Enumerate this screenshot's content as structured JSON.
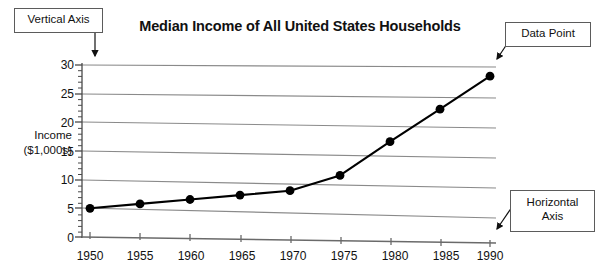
{
  "chart_data": {
    "type": "line",
    "title": "Median Income of All United States Households",
    "xlabel": "",
    "ylabel": "Income ($1,000s)",
    "ylabel_lines": [
      "Income",
      "($1,000s)"
    ],
    "x": [
      1950,
      1955,
      1960,
      1965,
      1970,
      1975,
      1980,
      1985,
      1990
    ],
    "values": [
      5.0,
      5.9,
      6.8,
      7.7,
      8.6,
      11.4,
      17.4,
      23.2,
      29.1
    ],
    "xticks": [
      "1950",
      "1955",
      "1960",
      "1965",
      "1970",
      "1975",
      "1980",
      "1985",
      "1990"
    ],
    "yticks": [
      "0",
      "5",
      "10",
      "15",
      "20",
      "25",
      "30"
    ],
    "ytick_values": [
      0,
      5,
      10,
      15,
      20,
      25,
      30
    ],
    "xlim": [
      1950,
      1990
    ],
    "ylim": [
      0,
      30
    ],
    "grid": true,
    "grid_axis": "y",
    "legend": false,
    "minor_ticks_y": true,
    "marker": "filled-circle",
    "line_color": "#000000",
    "marker_color": "#000000",
    "grid_color": "#888888",
    "axis_color": "#555555"
  },
  "annotations": [
    {
      "id": "vertical-axis",
      "label": "Vertical Axis",
      "lines": [
        "Vertical Axis"
      ]
    },
    {
      "id": "data-point",
      "label": "Data Point",
      "lines": [
        "Data Point"
      ]
    },
    {
      "id": "horizontal-axis",
      "label": "Horizontal Axis",
      "lines": [
        "Horizontal",
        "Axis"
      ]
    }
  ]
}
